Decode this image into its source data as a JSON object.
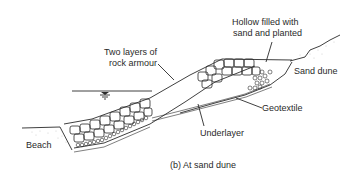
{
  "figure": {
    "caption": "(b)  At sand dune",
    "labels": {
      "hollow_line1": "Hollow filled with",
      "hollow_line2": "sand and planted",
      "rock_line1": "Two layers of",
      "rock_line2": "rock armour",
      "sand_dune": "Sand dune",
      "geotextile": "Geotextile",
      "underlayer": "Underlayer",
      "beach": "Beach"
    },
    "symbols": {
      "water_level": "water-level-symbol"
    },
    "colors": {
      "line": "#2a2a2a",
      "background": "#ffffff",
      "stipple": "#9a9a9a"
    }
  }
}
